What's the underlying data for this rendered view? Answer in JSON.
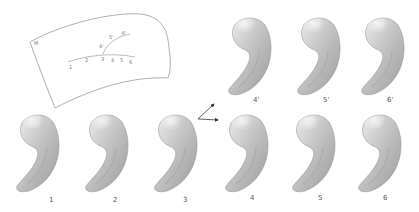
{
  "figure": {
    "manifold": {
      "label": "M",
      "curve_points": [
        "1",
        "2",
        "3",
        "4",
        "5",
        "6"
      ],
      "branch_points": [
        "4'",
        "5'",
        "6'"
      ]
    },
    "bottom_row": {
      "labels": [
        "1",
        "2",
        "3",
        "4",
        "5",
        "6"
      ]
    },
    "top_row": {
      "labels": [
        "4'",
        "5'",
        "6'"
      ]
    },
    "arrows": {
      "from": "3",
      "to": [
        "4'",
        "4"
      ]
    },
    "colors": {
      "shape_light": "#e6e6e6",
      "shape_mid": "#b8b8b8",
      "shape_dark": "#8c8c8c",
      "line": "#888888",
      "arrow": "#333333"
    }
  }
}
